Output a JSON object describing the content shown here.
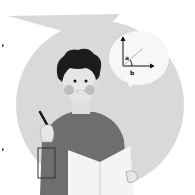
{
  "illustration": {
    "description": "Student holding pencil and open book, thinking about an angle between axes",
    "thought_bubble": {
      "label_a": "a",
      "label_b": "b",
      "icon": "axes-angle-icon"
    },
    "colors": {
      "background": "#ffffff",
      "circle": "#d9d9d9",
      "bubble": "#f7f7f7",
      "hair": "#1c1c1c",
      "skin": "#e6e6e6",
      "cheek": "#bdbdbd",
      "shirt": "#6e6e6e",
      "book": "#f4f4f4",
      "ink": "#111111"
    }
  }
}
